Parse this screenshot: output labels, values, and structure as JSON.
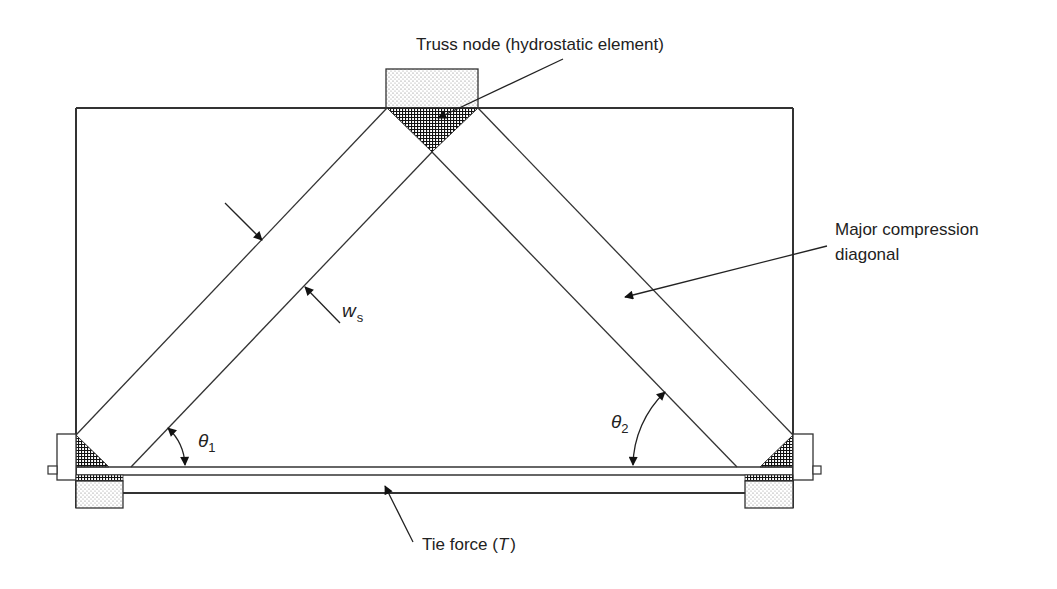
{
  "figure": {
    "labels": {
      "truss_node": "Truss node (hydrostatic element)",
      "major_diagonal_line1": "Major compression",
      "major_diagonal_line2": "diagonal",
      "tie_force_prefix": "Tie force (",
      "tie_force_symbol": "T",
      "tie_force_suffix": ")",
      "strut_width_symbol": "w",
      "strut_width_subscript": "s",
      "theta1_symbol": "θ",
      "theta1_subscript": "1",
      "theta2_symbol": "θ",
      "theta2_subscript": "2"
    },
    "components": [
      "deep beam outline",
      "left compression strut",
      "right compression strut (major compression diagonal)",
      "top truss node (hydrostatic element)",
      "left support node",
      "right support node",
      "tension tie",
      "left bearing pad",
      "right bearing pad",
      "top loading plate",
      "left anchor plate",
      "right anchor plate"
    ],
    "colors": {
      "line": "#333333",
      "text": "#222222",
      "node_hatch": "#111111",
      "pad_stipple": "#777777",
      "background": "#ffffff"
    }
  }
}
